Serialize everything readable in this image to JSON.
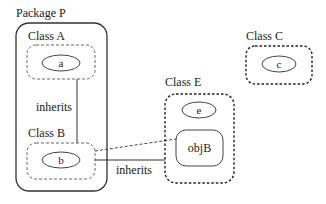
{
  "package": {
    "label": "Package P",
    "classes": [
      {
        "id": "A",
        "label": "Class A",
        "object": "a"
      },
      {
        "id": "B",
        "label": "Class B",
        "object": "b"
      }
    ],
    "inherits_label": "inherits"
  },
  "class_c": {
    "label": "Class C",
    "object": "c"
  },
  "class_e": {
    "label": "Class E",
    "object": "e",
    "member": "objB"
  },
  "edges": [
    {
      "from": "Class A",
      "to": "Class B",
      "style": "solid",
      "label": "inherits"
    },
    {
      "from": "Class B",
      "to": "Class E",
      "style": "solid",
      "label": "inherits"
    },
    {
      "from": "b",
      "to": "objB",
      "style": "dashed",
      "label": ""
    }
  ],
  "colors": {
    "stroke": "#333333",
    "dashed_stroke": "#555555",
    "background": "#ffffff"
  }
}
